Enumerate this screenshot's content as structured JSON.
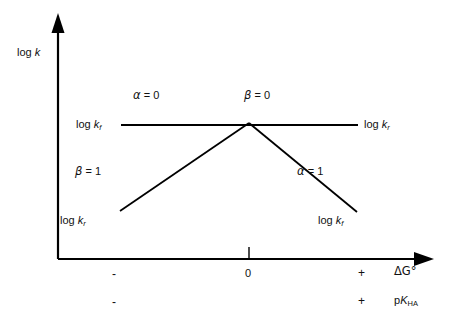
{
  "figure": {
    "type": "brønsted-relation-diagram",
    "axes": {
      "y_label": "log k",
      "y_label_parts": {
        "prefix": "log ",
        "symbol": "k"
      },
      "x_label_row1": "ΔG°",
      "x_label_row2": "pK",
      "x_label_row2_sub": "HA",
      "x_ticks_row1": [
        "-",
        "0",
        "+"
      ],
      "x_ticks_row2": [
        "-",
        "+"
      ],
      "x_axis_arrow": "arrow-right",
      "y_axis_arrow": "arrow-up",
      "zero_tick": "0"
    },
    "curves": {
      "plateau": {
        "name": "horizontal-plateau-line",
        "left_end_label": {
          "prefix": "log ",
          "symbol": "k",
          "sub": "f"
        },
        "right_end_label": {
          "prefix": "log ",
          "symbol": "k",
          "sub": "r"
        },
        "left_slope_label": {
          "greek": "α",
          "eq": " = 0"
        },
        "right_slope_label": {
          "greek": "β",
          "eq": " = 0"
        }
      },
      "rising": {
        "name": "rising-diagonal-line",
        "low_end_label": {
          "prefix": "log ",
          "symbol": "k",
          "sub": "r"
        },
        "slope_label": {
          "greek": "β",
          "eq": " = 1"
        }
      },
      "falling": {
        "name": "falling-diagonal-line",
        "low_end_label": {
          "prefix": "log ",
          "symbol": "k",
          "sub": "f"
        },
        "slope_label": {
          "greek": "α",
          "eq": " = 1"
        }
      }
    }
  },
  "chart_data": {
    "type": "line",
    "title": "",
    "xlabel": "ΔG° / pK_HA",
    "ylabel": "log k",
    "xlim": [
      -1,
      1
    ],
    "ylim": [
      0,
      1
    ],
    "grid": false,
    "legend": "none",
    "series": [
      {
        "name": "log k_f (plateau then falling)",
        "x": [
          -1.0,
          0.0,
          0.82
        ],
        "y": [
          0.72,
          0.72,
          0.12
        ],
        "slope_labels": [
          "α = 0",
          "α = 1"
        ]
      },
      {
        "name": "log k_r (rising then plateau)",
        "x": [
          -0.82,
          0.0,
          1.0
        ],
        "y": [
          0.12,
          0.72,
          0.72
        ],
        "slope_labels": [
          "β = 1",
          "β = 0"
        ]
      }
    ],
    "annotations": [
      {
        "text": "α = 0",
        "x": -0.55,
        "y": 0.86
      },
      {
        "text": "β = 0",
        "x": 0.3,
        "y": 0.86
      },
      {
        "text": "β = 1",
        "x": -0.72,
        "y": 0.38
      },
      {
        "text": "α = 1",
        "x": 0.52,
        "y": 0.38
      },
      {
        "text": "log k_f",
        "x": -1.05,
        "y": 0.72
      },
      {
        "text": "log k_r",
        "x": 1.05,
        "y": 0.72
      },
      {
        "text": "log k_r",
        "x": -0.95,
        "y": 0.08
      },
      {
        "text": "log k_f",
        "x": 0.95,
        "y": 0.08
      }
    ],
    "crossing_point": {
      "x": 0.0,
      "y": 0.72
    }
  },
  "colors": {
    "line": "#000000",
    "background": "#ffffff",
    "text": "#111111"
  }
}
